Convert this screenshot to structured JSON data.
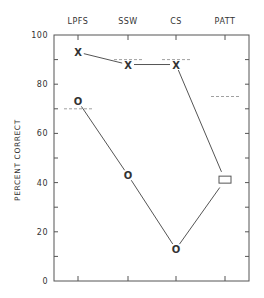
{
  "chart_data": {
    "type": "line",
    "title": "",
    "xlabel": "",
    "ylabel": "PERCENT CORRECT",
    "categories": [
      "LPFS",
      "SSW",
      "CS",
      "PATT"
    ],
    "ylim": [
      0,
      100
    ],
    "yticks": [
      "0",
      "20",
      "40",
      "60",
      "80",
      "100"
    ],
    "series": [
      {
        "name": "X",
        "marker": "X",
        "values": [
          93,
          88,
          88,
          41
        ]
      },
      {
        "name": "O",
        "marker": "O",
        "values": [
          73,
          43,
          13,
          41
        ]
      }
    ],
    "shared_point": {
      "category": "PATT",
      "value": 41,
      "marker": "rectangle"
    },
    "norms": [
      {
        "category": "LPFS",
        "value": 70
      },
      {
        "category": "SSW",
        "value": 90
      },
      {
        "category": "CS",
        "value": 90
      },
      {
        "category": "PATT",
        "value": 75
      }
    ],
    "grid": false,
    "legend": "none"
  }
}
